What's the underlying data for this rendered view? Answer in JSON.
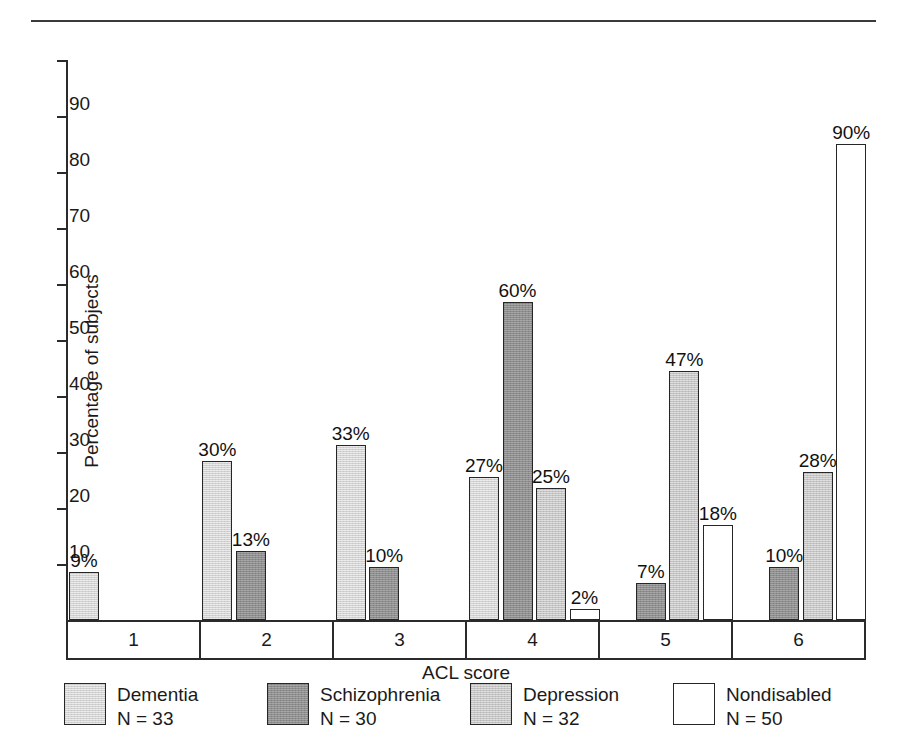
{
  "chart_data": {
    "type": "bar",
    "title": "",
    "xlabel": "ACL score",
    "ylabel": "Percentage of subjects",
    "categories": [
      "1",
      "2",
      "3",
      "4",
      "5",
      "6"
    ],
    "ylim": [
      0,
      100
    ],
    "yticks": [
      10,
      20,
      30,
      40,
      50,
      60,
      70,
      80,
      90
    ],
    "ytick_labels": [
      "10",
      "20",
      "30",
      "40",
      "50",
      "60",
      "70",
      "80",
      "90"
    ],
    "grid": false,
    "legend_position": "bottom",
    "value_suffix": "%",
    "series": [
      {
        "name": "Dementia",
        "n_label": "N = 33",
        "color": "#d2d2d2",
        "values": [
          9,
          30,
          33,
          27,
          null,
          null
        ],
        "value_labels": [
          "9%",
          "30%",
          "33%",
          "27%",
          "",
          ""
        ]
      },
      {
        "name": "Schizophrenia",
        "n_label": "N = 30",
        "color": "#8e8e8e",
        "values": [
          null,
          13,
          10,
          60,
          7,
          10
        ],
        "value_labels": [
          "",
          "13%",
          "10%",
          "60%",
          "7%",
          "10%"
        ]
      },
      {
        "name": "Depression",
        "n_label": "N = 32",
        "color": "#c4c4c4",
        "values": [
          null,
          null,
          null,
          25,
          47,
          28
        ],
        "value_labels": [
          "",
          "",
          "",
          "25%",
          "47%",
          "28%"
        ]
      },
      {
        "name": "Nondisabled",
        "n_label": "N = 50",
        "color": "#ffffff",
        "values": [
          null,
          null,
          null,
          2,
          18,
          90
        ],
        "value_labels": [
          "",
          "",
          "",
          "2%",
          "18%",
          "90%"
        ]
      }
    ]
  },
  "axis": {
    "y_title": "Percentage of subjects",
    "x_title": "ACL score"
  },
  "legend": {
    "items": [
      {
        "label": "Dementia",
        "n": "N = 33"
      },
      {
        "label": "Schizophrenia",
        "n": "N = 30"
      },
      {
        "label": "Depression",
        "n": "N = 32"
      },
      {
        "label": "Nondisabled",
        "n": "N = 50"
      }
    ]
  },
  "ticks": {
    "labels": [
      "90",
      "80",
      "70",
      "60",
      "50",
      "40",
      "30",
      "20",
      "10"
    ]
  },
  "categories": {
    "labels": [
      "1",
      "2",
      "3",
      "4",
      "5",
      "6"
    ]
  }
}
